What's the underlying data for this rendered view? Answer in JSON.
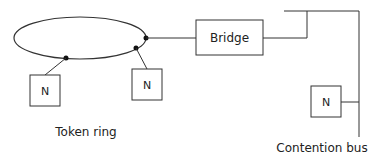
{
  "diagram": {
    "ring_label": "Token ring",
    "bus_label": "Contention bus",
    "bridge_label": "Bridge",
    "nodes": [
      {
        "label": "N",
        "network": "token-ring"
      },
      {
        "label": "N",
        "network": "token-ring"
      },
      {
        "label": "N",
        "network": "contention-bus"
      }
    ],
    "colors": {
      "stroke": "#333333",
      "background": "#ffffff"
    }
  }
}
